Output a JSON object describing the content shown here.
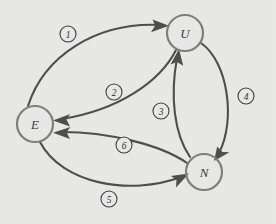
{
  "diagram": {
    "background_color": "#e9e9e7",
    "node_stroke_color": "#7f7f7f",
    "edge_color": "#4e4e4e",
    "label_text_color": "#2e2e2e",
    "nodes": [
      {
        "id": "E",
        "label": "E",
        "cx": 35,
        "cy": 124,
        "r": 18
      },
      {
        "id": "U",
        "label": "U",
        "cx": 185,
        "cy": 33,
        "r": 18
      },
      {
        "id": "N",
        "label": "N",
        "cx": 204,
        "cy": 172,
        "r": 18
      }
    ],
    "edges": [
      {
        "id": "1",
        "label": "1",
        "from": "E",
        "to": "U",
        "label_x": 68,
        "label_y": 34,
        "label_r": 8
      },
      {
        "id": "2",
        "label": "2",
        "from": "U",
        "to": "E",
        "label_x": 114,
        "label_y": 92,
        "label_r": 8
      },
      {
        "id": "3",
        "label": "3",
        "from": "N",
        "to": "U",
        "label_x": 161,
        "label_y": 111,
        "label_r": 8
      },
      {
        "id": "4",
        "label": "4",
        "from": "U",
        "to": "N",
        "label_x": 246,
        "label_y": 96,
        "label_r": 8
      },
      {
        "id": "5",
        "label": "5",
        "from": "E",
        "to": "N",
        "label_x": 109,
        "label_y": 199,
        "label_r": 8
      },
      {
        "id": "6",
        "label": "6",
        "from": "N",
        "to": "E",
        "label_x": 124,
        "label_y": 145,
        "label_r": 8
      }
    ]
  }
}
